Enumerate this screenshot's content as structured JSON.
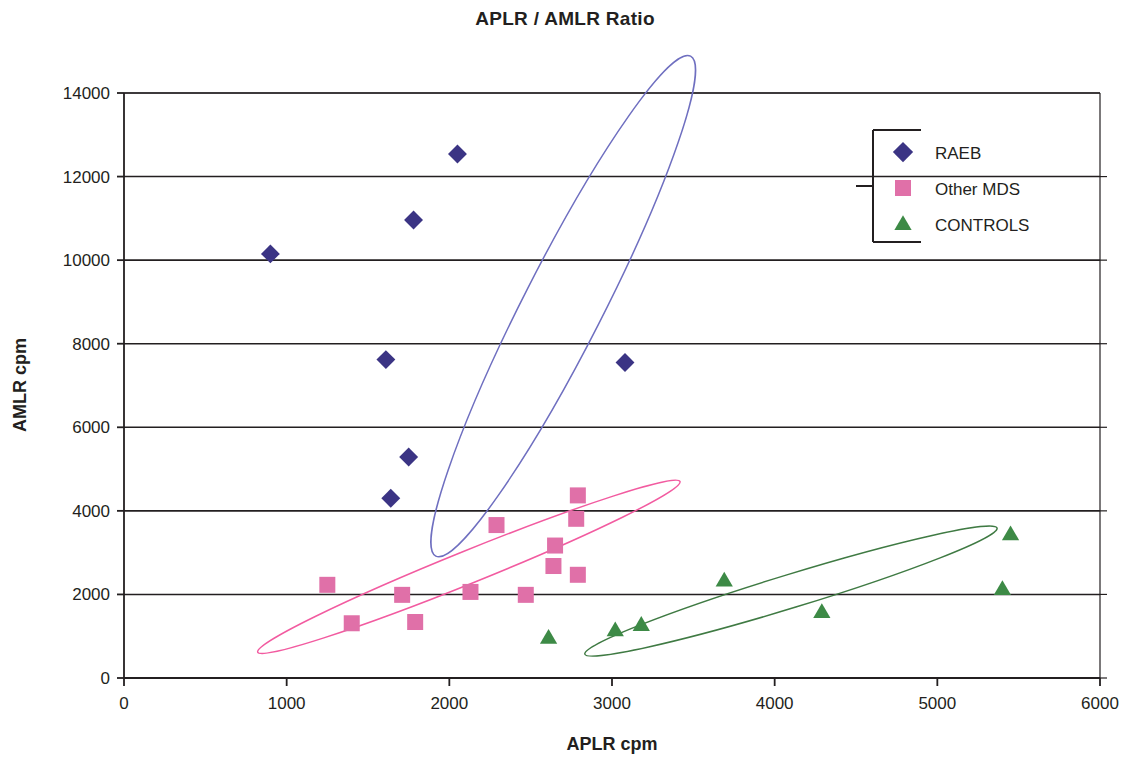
{
  "chart_data": {
    "type": "scatter",
    "title": "APLR / AMLR Ratio",
    "xlabel": "APLR cpm",
    "ylabel": "AMLR cpm",
    "xlim": [
      0,
      6000
    ],
    "ylim": [
      0,
      14000
    ],
    "xticks": [
      "0",
      "1000",
      "2000",
      "3000",
      "4000",
      "5000",
      "6000"
    ],
    "yticks": [
      "0",
      "2000",
      "4000",
      "6000",
      "8000",
      "10000",
      "12000",
      "14000"
    ],
    "grid": "horizontal",
    "legend_position": "top-right",
    "series": [
      {
        "name": "RAEB",
        "marker": "diamond",
        "color": "#3b3484",
        "ellipse_color": "#6f6fc0",
        "points": [
          {
            "x": 900,
            "y": 10150
          },
          {
            "x": 1610,
            "y": 7620
          },
          {
            "x": 1780,
            "y": 10960
          },
          {
            "x": 2050,
            "y": 12540
          },
          {
            "x": 1750,
            "y": 5290
          },
          {
            "x": 1640,
            "y": 4300
          },
          {
            "x": 3080,
            "y": 7550
          }
        ],
        "ellipse": {
          "cx": 2700,
          "cy": 8900,
          "rx": 3450,
          "ry": 1900,
          "rotation": -63
        }
      },
      {
        "name": "Other MDS",
        "marker": "square",
        "color": "#e070a8",
        "ellipse_color": "#f25ba0",
        "points": [
          {
            "x": 1250,
            "y": 2230
          },
          {
            "x": 1400,
            "y": 1310
          },
          {
            "x": 1710,
            "y": 1990
          },
          {
            "x": 1790,
            "y": 1340
          },
          {
            "x": 2130,
            "y": 2060
          },
          {
            "x": 2290,
            "y": 3660
          },
          {
            "x": 2470,
            "y": 1990
          },
          {
            "x": 2640,
            "y": 2680
          },
          {
            "x": 2650,
            "y": 3170
          },
          {
            "x": 2790,
            "y": 4370
          },
          {
            "x": 2780,
            "y": 3810
          },
          {
            "x": 2790,
            "y": 2470
          }
        ],
        "ellipse": {
          "cx": 2120,
          "cy": 2660,
          "rx": 2800,
          "ry": 780,
          "rotation": -22
        }
      },
      {
        "name": "CONTROLS",
        "marker": "triangle",
        "color": "#3d8a46",
        "ellipse_color": "#3f7a43",
        "points": [
          {
            "x": 2610,
            "y": 960
          },
          {
            "x": 3020,
            "y": 1140
          },
          {
            "x": 3180,
            "y": 1270
          },
          {
            "x": 3690,
            "y": 2330
          },
          {
            "x": 4290,
            "y": 1580
          },
          {
            "x": 5400,
            "y": 2130
          },
          {
            "x": 5450,
            "y": 3440
          }
        ],
        "ellipse": {
          "cx": 4100,
          "cy": 2080,
          "rx": 2650,
          "ry": 800,
          "rotation": -17
        }
      }
    ]
  },
  "legend": {
    "items": [
      {
        "label": "RAEB"
      },
      {
        "label": "Other MDS"
      },
      {
        "label": "CONTROLS"
      }
    ]
  }
}
